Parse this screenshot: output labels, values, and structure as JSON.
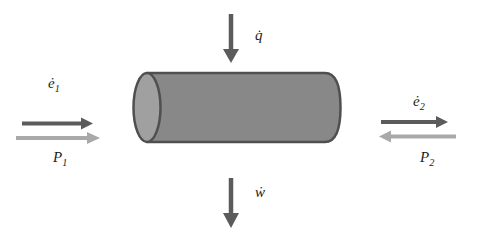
{
  "diagram": {
    "colors": {
      "background": "#ffffff",
      "dark": "#5b5b5b",
      "light": "#a9a9a9",
      "cylinder_fill": "#888888",
      "cylinder_cap_fill": "#a0a0a0",
      "cylinder_outline": "#4f4f4f",
      "text": "#1c1c1c"
    },
    "labels": {
      "heat": "q̇",
      "work": "ẇ",
      "energy_in_base": "ė",
      "energy_in_sub": "1",
      "energy_out_base": "ė",
      "energy_out_sub": "2",
      "pressure_in_base": "P",
      "pressure_in_sub": "1",
      "pressure_out_base": "P",
      "pressure_out_sub": "2"
    },
    "arrows": [
      {
        "name": "heat-in",
        "label": "q̇",
        "direction": "down",
        "shade": "dark"
      },
      {
        "name": "energy-in",
        "label": "ė1",
        "direction": "right",
        "shade": "dark"
      },
      {
        "name": "pressure-in",
        "label": "P1",
        "direction": "right",
        "shade": "light"
      },
      {
        "name": "energy-out",
        "label": "ė2",
        "direction": "right",
        "shade": "dark"
      },
      {
        "name": "pressure-out",
        "label": "P2",
        "direction": "left",
        "shade": "light"
      },
      {
        "name": "work-out",
        "label": "ẇ",
        "direction": "down",
        "shade": "dark"
      }
    ]
  }
}
